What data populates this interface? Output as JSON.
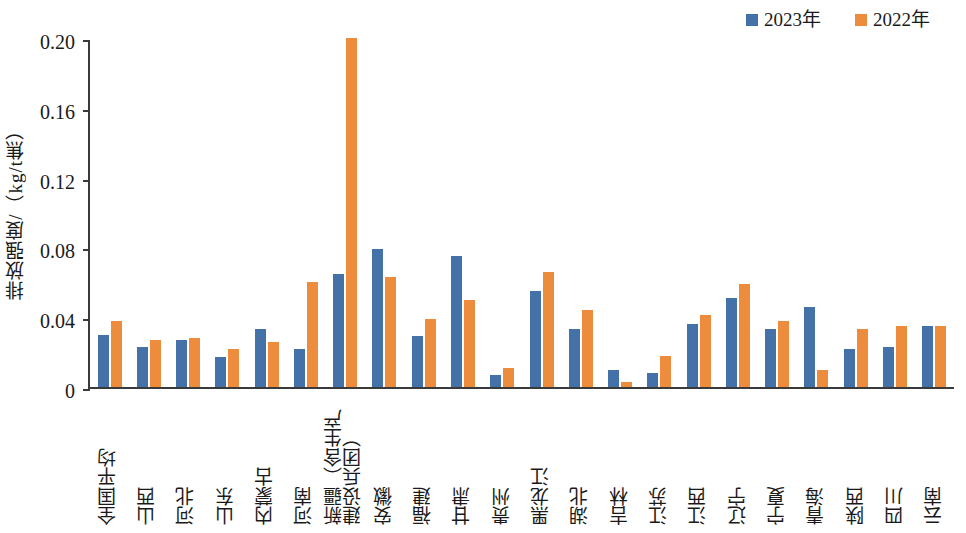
{
  "legend": {
    "position": "top-right",
    "items": [
      {
        "label": "2023年",
        "color": "#4472A8",
        "icon": "square-swatch"
      },
      {
        "label": "2022年",
        "color": "#ED8C3C",
        "icon": "square-swatch"
      }
    ]
  },
  "axes": {
    "y_title": "排放强度/（kg/t焦）",
    "y_ticks": [
      "0.20",
      "0.16",
      "0.12",
      "0.08",
      "0.04",
      "0"
    ],
    "x_title": ""
  },
  "chart_data": {
    "type": "bar",
    "title": "",
    "subtitle": "",
    "xlabel": "",
    "ylabel": "排放强度/（kg/t焦）",
    "ylim": [
      0,
      0.2
    ],
    "ytick_values": [
      0,
      0.04,
      0.08,
      0.12,
      0.16,
      0.2
    ],
    "grid": false,
    "legend_position": "top-right",
    "categories": [
      "全国平均",
      "山西",
      "河北",
      "山东",
      "内蒙古",
      "河南",
      "新疆（含生产建设兵团）",
      "安徽",
      "福建",
      "甘肃",
      "贵州",
      "黑龙江",
      "湖北",
      "吉林",
      "江苏",
      "江西",
      "辽宁",
      "宁夏",
      "青海",
      "陕西",
      "四川",
      "云南"
    ],
    "series": [
      {
        "name": "2023年",
        "color": "#4472A8",
        "values": [
          0.03,
          0.023,
          0.027,
          0.017,
          0.033,
          0.022,
          0.065,
          0.079,
          0.029,
          0.075,
          0.007,
          0.055,
          0.033,
          0.01,
          0.008,
          0.036,
          0.051,
          0.033,
          0.046,
          0.022,
          0.023,
          0.035
        ]
      },
      {
        "name": "2022年",
        "color": "#ED8C3C",
        "values": [
          0.038,
          0.027,
          0.028,
          0.022,
          0.026,
          0.06,
          0.2,
          0.063,
          0.039,
          0.05,
          0.011,
          0.066,
          0.044,
          0.003,
          0.018,
          0.041,
          0.059,
          0.038,
          0.01,
          0.033,
          0.035,
          0.035
        ]
      }
    ]
  }
}
